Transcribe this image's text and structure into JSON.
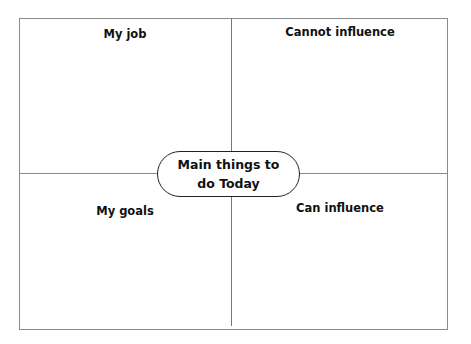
{
  "diagram": {
    "center": {
      "line1": "Main things to",
      "line2": "do Today"
    },
    "quadrants": {
      "top_left": "My job",
      "top_right": "Cannot influence",
      "bottom_left": "My goals",
      "bottom_right": "Can influence"
    }
  }
}
